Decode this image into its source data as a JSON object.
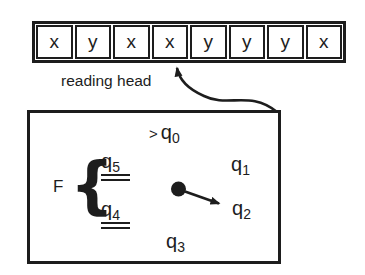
{
  "tape": {
    "cells": [
      "x",
      "y",
      "x",
      "x",
      "y",
      "y",
      "y",
      "x"
    ],
    "reading_head_label": "reading head"
  },
  "machine": {
    "start_marker": ">",
    "final_set_label": "F",
    "brace": "{",
    "states": {
      "q0": {
        "base": "q",
        "sub": "0"
      },
      "q1": {
        "base": "q",
        "sub": "1"
      },
      "q2": {
        "base": "q",
        "sub": "2"
      },
      "q3": {
        "base": "q",
        "sub": "3"
      },
      "q4": {
        "base": "q",
        "sub": "4"
      },
      "q5": {
        "base": "q",
        "sub": "5"
      }
    }
  },
  "colors": {
    "ink": "#1d1d1d",
    "background": "#ffffff"
  }
}
